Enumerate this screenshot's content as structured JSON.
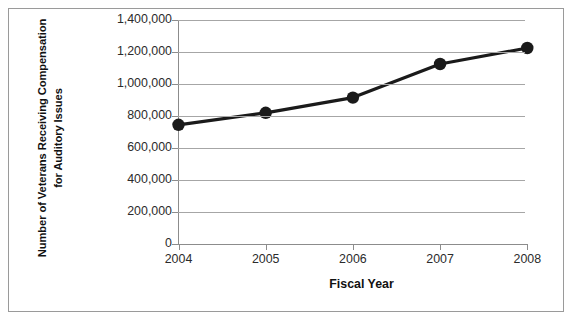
{
  "chart_data": {
    "type": "line",
    "title": "",
    "xlabel": "Fiscal Year",
    "ylabel": "Number of Veterans Receiving Compensation for Auditory Issues",
    "categories": [
      "2004",
      "2005",
      "2006",
      "2007",
      "2008"
    ],
    "x": [
      2004,
      2005,
      2006,
      2007,
      2008
    ],
    "values": [
      745000,
      820000,
      915000,
      1125000,
      1225000
    ],
    "series": [
      {
        "name": "Veterans Receiving Compensation for Auditory Issues",
        "values": [
          745000,
          820000,
          915000,
          1125000,
          1225000
        ]
      }
    ],
    "ylim": [
      0,
      1400000
    ],
    "ytick_labels": [
      "1,400,000",
      "1,200,000",
      "1,000,000",
      "800,000",
      "600,000",
      "400,000",
      "200,000",
      "0"
    ],
    "ytick_values": [
      1400000,
      1200000,
      1000000,
      800000,
      600000,
      400000,
      200000,
      0
    ],
    "grid": "horizontal",
    "legend": "none",
    "marker": "filled-circle",
    "line_color": "#1a1a1a",
    "marker_color": "#1a1a1a",
    "grid_color": "#a6a6a6",
    "axis_color": "#8c8c8c"
  },
  "axes": {
    "y_title": "Number of Veterans Receiving Compensation for Auditory Issues",
    "x_title": "Fiscal Year"
  }
}
